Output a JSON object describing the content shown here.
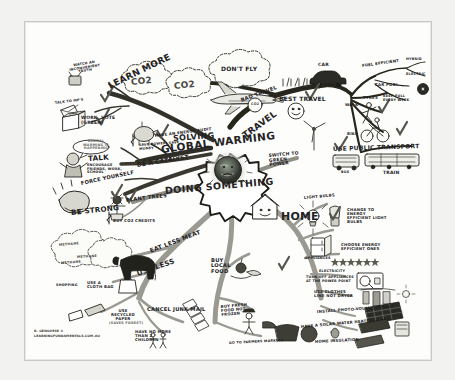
{
  "poster": {
    "type": "hand-drawn mind map",
    "title_lines": [
      "SOLVING",
      "GLOBAL WARMING",
      "DOING SOMETHING"
    ],
    "center_icon": "earth-sad-face-icon",
    "credit_lines": [
      "R. GENOVESE ©",
      "LEARNINGFUNDAMENTALS.COM.AU"
    ],
    "colors": {
      "paper": "#fdfdfb",
      "ink": "#23221f",
      "branch_dark": "#2b2b27",
      "branch_grey": "#9a9a93",
      "accent_check": "#55554f"
    }
  },
  "branches": [
    {
      "id": "learn-more",
      "label": "LEARN MORE",
      "children": [
        {
          "label": "WATCH AN INCONVENIENT TRUTH",
          "icon": "tv-icon"
        },
        {
          "label": "TALK TO MP'S",
          "icon": "envelope-icon"
        },
        {
          "label": "WORK, VOTE (GREEN)",
          "icon": "ballot-box-icon"
        }
      ]
    },
    {
      "id": "talk",
      "label": "TALK",
      "children": [
        {
          "label": "GLOBAL WARMING IS HAPPENING",
          "icon": "speech-bubble-icon"
        },
        {
          "label": "ENCOURAGE FRIENDS, WORK, SCHOOL",
          "icon": "person-icon"
        }
      ]
    },
    {
      "id": "be-strong",
      "label": "BE STRONG",
      "children": [
        {
          "label": "FORCE YOURSELF",
          "icon": "flexing-arm-icon"
        }
      ]
    },
    {
      "id": "be-a-catalyst",
      "label": "BE A CATALYST",
      "children": [
        {
          "label": "HAVE AN ENERGY AUDIT",
          "icon": "piggy-bank-icon"
        },
        {
          "label": "SAVE POWER, SAVE MONEY",
          "icon": "dollar-icon"
        }
      ]
    },
    {
      "id": "plant-trees",
      "label": "PLANT TREES",
      "children": [
        {
          "label": "BUY CO2 CREDITS",
          "icon": "dollar-icon"
        }
      ]
    },
    {
      "id": "use-less",
      "label": "USE LESS",
      "children": [
        {
          "label": "EAT LESS MEAT",
          "icon": "cow-icon"
        },
        {
          "label": "METHANE",
          "icon": "cloud-icon"
        },
        {
          "label": "SHOPPING",
          "icon": "bag-icon"
        },
        {
          "label": "USE A CLOTH BAG",
          "icon": "cloth-bag-icon"
        },
        {
          "label": "USE RECYCLED PAPER",
          "icon": "eraser-icon"
        },
        {
          "label": "(SAVES FOREST)",
          "icon": "none"
        },
        {
          "label": "CANCEL JUNK MAIL",
          "icon": "letters-icon"
        },
        {
          "label": "HAVE NO MORE THAN 2 CHILDREN",
          "icon": "children-icon"
        }
      ]
    },
    {
      "id": "buy-local-food",
      "label": "BUY LOCAL FOOD",
      "children": [
        {
          "label": "BUY FRESH FOOD NOT FROZEN",
          "icon": "apple-icon"
        },
        {
          "label": "GO TO FARMERS MARKETS",
          "icon": "farmer-icon"
        }
      ]
    },
    {
      "id": "travel",
      "label": "TRAVEL",
      "children": [
        {
          "label": "BAD TRAVEL",
          "icon": "airplane-icon"
        },
        {
          "label": "DON'T FLY",
          "icon": "airplane-icon"
        },
        {
          "label": "CO2",
          "icon": "cloud-icon"
        },
        {
          "label": "BEST TRAVEL",
          "icon": "grass-icon"
        }
      ]
    },
    {
      "id": "best-travel",
      "label": "BEST TRAVEL",
      "children": [
        {
          "label": "CAR",
          "icon": "car-icon"
        },
        {
          "label": "FUEL EFFICIENT",
          "icon": "none"
        },
        {
          "label": "HYBRID",
          "icon": "none"
        },
        {
          "label": "ELECTRIC",
          "icon": "none"
        },
        {
          "label": "CAR POOL",
          "icon": "none"
        },
        {
          "label": "TYRES",
          "icon": "tyre-icon"
        },
        {
          "label": "KEEP FULL EVERY WEEK",
          "icon": "none"
        },
        {
          "label": "WALK",
          "icon": "walking-person-icon"
        },
        {
          "label": "BIKE",
          "icon": "bicycle-icon"
        },
        {
          "label": "USE PUBLIC TRANSPORT",
          "icon": "bus-icon"
        },
        {
          "label": "BUS",
          "icon": "bus-icon"
        },
        {
          "label": "TRAIN",
          "icon": "train-icon"
        }
      ]
    },
    {
      "id": "green-power",
      "label": "SWITCH TO GREEN POWER",
      "children": [
        {
          "label": "WIND TURBINE",
          "icon": "wind-turbine-icon"
        }
      ]
    },
    {
      "id": "home",
      "label": "HOME",
      "children": [
        {
          "label": "LIGHT BULBS",
          "icon": "light-bulb-icon"
        },
        {
          "label": "CHANGE TO ENERGY EFFICIENT LIGHT BULBS",
          "icon": "cfl-bulb-icon"
        },
        {
          "label": "APPLIANCES",
          "icon": "fridge-icon"
        },
        {
          "label": "CHOOSE ENERGY EFFICIENT ONES",
          "icon": "star-rating-icon"
        },
        {
          "label": "ELECTRICITY",
          "icon": "power-point-icon"
        },
        {
          "label": "TURN OFF APPLIANCES AT THE POWER POINT",
          "icon": "switch-icon"
        },
        {
          "label": "USE CLOTHES LINE NOT DRYER",
          "icon": "clothesline-icon"
        },
        {
          "label": "INSTALL PHOTO-VOLTAIC PANELS",
          "icon": "solar-panel-icon"
        },
        {
          "label": "HAVE A SOLAR WATER HEATER",
          "icon": "solar-heater-icon"
        },
        {
          "label": "HOME INSULATION",
          "icon": "insulation-icon"
        }
      ]
    }
  ]
}
